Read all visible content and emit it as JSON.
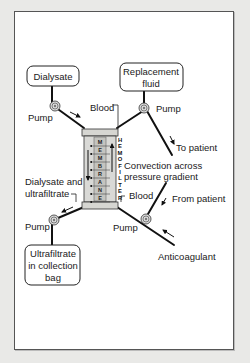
{
  "diagram": {
    "boxes": {
      "dialysate": "Dialysate",
      "replacement_fluid": [
        "Replacement",
        "fluid"
      ],
      "ultrafiltrate": [
        "Ultrafiltrate",
        "in collection",
        "bag"
      ]
    },
    "labels": {
      "pump_dialysate": "Pump",
      "pump_replacement": "Pump",
      "pump_ultrafiltrate": "Pump",
      "pump_blood": "Pump",
      "blood_top": "Blood",
      "blood_bottom": "Blood",
      "to_patient": "To patient",
      "from_patient": "From patient",
      "convection": [
        "Convection across",
        "pressure gradient"
      ],
      "dialysate_ultrafiltrate": [
        "Dialysate and",
        "ultrafiltrate"
      ],
      "anticoagulant": "Anticoagulant"
    },
    "membrane_letters": [
      "M",
      "E",
      "M",
      "B",
      "R",
      "A",
      "N",
      "E"
    ],
    "hemofilter_letters": [
      "H",
      "E",
      "M",
      "O",
      "F",
      "I",
      "L",
      "T",
      "E",
      "R"
    ],
    "colors": {
      "background": "#e9e9e7",
      "panel": "#ffffff",
      "filter_fill": "#d9d9d6",
      "membrane_fill": "#c4c4c0",
      "line": "#111111"
    }
  }
}
